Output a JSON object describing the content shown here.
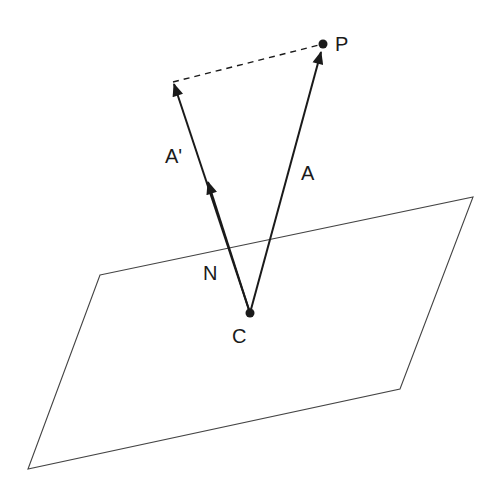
{
  "diagram": {
    "type": "vector-projection",
    "colors": {
      "background": "#ffffff",
      "stroke": "#1a1a1a",
      "plane": "#444444"
    },
    "plane": {
      "corners": [
        [
          100,
          275
        ],
        [
          473,
          197
        ],
        [
          400,
          389
        ],
        [
          28,
          469
        ]
      ]
    },
    "points": {
      "C": {
        "label": "C",
        "x": 250,
        "y": 313
      },
      "P": {
        "label": "P",
        "x": 323,
        "y": 44
      },
      "A_prime_tip": {
        "x": 173,
        "y": 82
      }
    },
    "vectors": [
      {
        "name": "A",
        "label": "A",
        "from": "C",
        "to": "P"
      },
      {
        "name": "A'",
        "label": "A'",
        "from": "C",
        "to": "A_prime_tip"
      },
      {
        "name": "N",
        "label": "N",
        "from": "C",
        "to": [
          208,
          180
        ]
      }
    ],
    "dashed_lines": [
      {
        "from": "A_prime_tip",
        "to": "P"
      }
    ],
    "labels": {
      "P": "P",
      "A": "A",
      "A_prime": "A'",
      "N": "N",
      "C": "C"
    }
  }
}
